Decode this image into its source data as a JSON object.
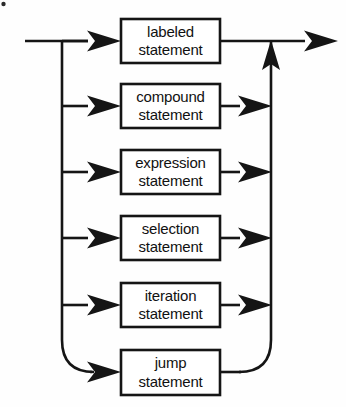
{
  "diagram": {
    "type": "railroad-syntax-diagram",
    "title": "statement",
    "orientation": "left-to-right",
    "background_color": "#fefefe",
    "line_color": "#151515",
    "box_fill": "#ffffff",
    "entry": {
      "x": 25,
      "y": 41,
      "label": "entry-rail"
    },
    "exit": {
      "x": 338,
      "y": 41,
      "label": "exit-rail"
    },
    "branch_rail_x": 62,
    "merge_rail_x": 271,
    "alternatives": [
      {
        "id": "labeled-statement",
        "line1": "labeled",
        "line2": "statement",
        "box": {
          "x": 121,
          "y": 19,
          "w": 99,
          "h": 44
        },
        "rail_y": 41,
        "row": 1
      },
      {
        "id": "compound-statement",
        "line1": "compound",
        "line2": "statement",
        "box": {
          "x": 121,
          "y": 84,
          "w": 99,
          "h": 44
        },
        "rail_y": 106,
        "row": 2
      },
      {
        "id": "expression-statement",
        "line1": "expression",
        "line2": "statement",
        "box": {
          "x": 121,
          "y": 150,
          "w": 99,
          "h": 44
        },
        "rail_y": 172,
        "row": 3
      },
      {
        "id": "selection-statement",
        "line1": "selection",
        "line2": "statement",
        "box": {
          "x": 121,
          "y": 216,
          "w": 99,
          "h": 44
        },
        "rail_y": 238,
        "row": 4
      },
      {
        "id": "iteration-statement",
        "line1": "iteration",
        "line2": "statement",
        "box": {
          "x": 121,
          "y": 283,
          "w": 99,
          "h": 44
        },
        "rail_y": 305,
        "row": 5
      },
      {
        "id": "jump-statement",
        "line1": "jump",
        "line2": "statement",
        "box": {
          "x": 121,
          "y": 350,
          "w": 99,
          "h": 45
        },
        "rail_y": 372,
        "row": 6
      }
    ],
    "arrow_count": 13,
    "scan_artifact": {
      "x": 3,
      "y": 4,
      "r": 2.2
    }
  }
}
